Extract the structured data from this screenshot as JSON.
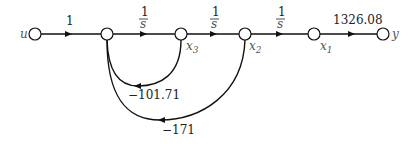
{
  "diagram": {
    "type": "signal-flow-graph",
    "nodes": [
      {
        "id": "u",
        "label": "u",
        "x": 35
      },
      {
        "id": "n1",
        "label": "",
        "x": 107
      },
      {
        "id": "x3",
        "label": "x",
        "sub": "3",
        "x": 181
      },
      {
        "id": "x2",
        "label": "x",
        "sub": "2",
        "x": 245
      },
      {
        "id": "x1",
        "label": "x",
        "sub": "1",
        "x": 314
      },
      {
        "id": "y",
        "label": "y",
        "x": 383
      }
    ],
    "forward_gains": {
      "u_n1": "1",
      "n1_x3_num": "1",
      "n1_x3_den": "s",
      "x3_x2_num": "1",
      "x3_x2_den": "s",
      "x2_x1_num": "1",
      "x2_x1_den": "s",
      "x1_y": "1326.08"
    },
    "feedback_gains": {
      "x3_n1": "−101.71",
      "x2_n1": "−171"
    }
  }
}
